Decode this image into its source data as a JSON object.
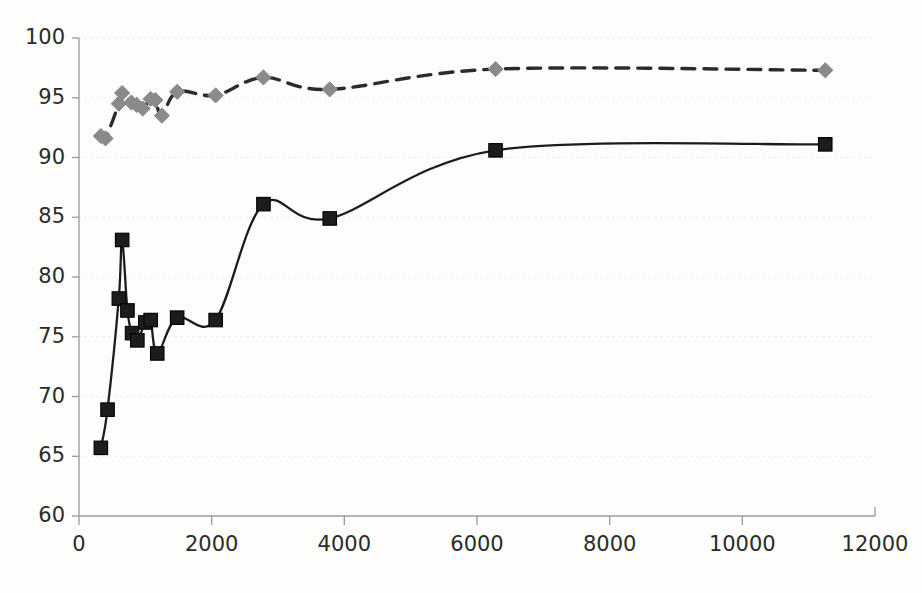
{
  "chart_data": {
    "type": "line",
    "title": "",
    "subtitle": "",
    "xlabel": "",
    "ylabel": "",
    "xlim": [
      0,
      12000
    ],
    "ylim": [
      60,
      100
    ],
    "xticks": [
      0,
      2000,
      4000,
      6000,
      8000,
      10000,
      12000
    ],
    "yticks": [
      60,
      65,
      70,
      75,
      80,
      85,
      90,
      95,
      100
    ],
    "xtick_labels": [
      "0",
      "2000",
      "4000",
      "6000",
      "8000",
      "10000",
      "12000"
    ],
    "ytick_labels": [
      "60",
      "65",
      "70",
      "75",
      "80",
      "85",
      "90",
      "95",
      "100"
    ],
    "grid": "horizontal-dotted-faint",
    "legend": "none",
    "legend_position": "none",
    "annotations": [],
    "series": [
      {
        "name": "Upper series",
        "marker": "diamond",
        "marker_color": "#8a8a8a",
        "line_style": "dashed",
        "line_color": "#2b2b2b",
        "points": [
          {
            "x": 330,
            "y": 91.8
          },
          {
            "x": 400,
            "y": 91.6
          },
          {
            "x": 600,
            "y": 94.5
          },
          {
            "x": 650,
            "y": 95.4
          },
          {
            "x": 790,
            "y": 94.6
          },
          {
            "x": 870,
            "y": 94.4
          },
          {
            "x": 960,
            "y": 94.1
          },
          {
            "x": 1080,
            "y": 94.9
          },
          {
            "x": 1150,
            "y": 94.8
          },
          {
            "x": 1250,
            "y": 93.5
          },
          {
            "x": 1480,
            "y": 95.5
          },
          {
            "x": 2060,
            "y": 95.2
          },
          {
            "x": 2780,
            "y": 96.7
          },
          {
            "x": 3780,
            "y": 95.7
          },
          {
            "x": 6280,
            "y": 97.4
          },
          {
            "x": 11250,
            "y": 97.3
          }
        ]
      },
      {
        "name": "Lower series",
        "marker": "square",
        "marker_color": "#1c1c1c",
        "line_style": "solid",
        "line_color": "#1c1c1c",
        "points": [
          {
            "x": 330,
            "y": 65.7
          },
          {
            "x": 430,
            "y": 68.9
          },
          {
            "x": 600,
            "y": 78.2
          },
          {
            "x": 650,
            "y": 83.1
          },
          {
            "x": 730,
            "y": 77.2
          },
          {
            "x": 800,
            "y": 75.3
          },
          {
            "x": 880,
            "y": 74.7
          },
          {
            "x": 1000,
            "y": 76.2
          },
          {
            "x": 1080,
            "y": 76.4
          },
          {
            "x": 1180,
            "y": 73.6
          },
          {
            "x": 1480,
            "y": 76.6
          },
          {
            "x": 2060,
            "y": 76.4
          },
          {
            "x": 2780,
            "y": 86.1
          },
          {
            "x": 3780,
            "y": 84.9
          },
          {
            "x": 6280,
            "y": 90.6
          },
          {
            "x": 11250,
            "y": 91.1
          }
        ]
      }
    ]
  },
  "colors": {
    "background": "#fdfdfc",
    "axis": "#9a9a9a",
    "grid": "#e9e9e6",
    "text": "#2b2b2b",
    "series_upper_marker": "#8a8a8a",
    "series_upper_line": "#2b2b2b",
    "series_lower_marker": "#1c1c1c",
    "series_lower_line": "#1c1c1c"
  }
}
